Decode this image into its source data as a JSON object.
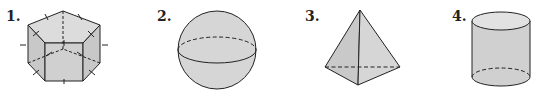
{
  "figures": [
    {
      "number": "1.",
      "shape": "pentagonal-prism"
    },
    {
      "number": "2.",
      "shape": "sphere"
    },
    {
      "number": "3.",
      "shape": "triangular-pyramid"
    },
    {
      "number": "4.",
      "shape": "cylinder"
    }
  ],
  "colors": {
    "fill": "#d4d4d4",
    "fill_light": "#e0e0e0",
    "fill_dark": "#c6c6c6",
    "stroke": "#222222"
  }
}
